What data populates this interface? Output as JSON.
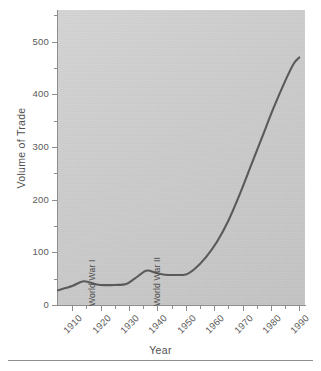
{
  "chart_data": {
    "type": "line",
    "title": "",
    "xlabel": "Year",
    "ylabel": "Volume of Trade",
    "xlim": [
      1905,
      1992
    ],
    "ylim": [
      0,
      560
    ],
    "grid": false,
    "legend": "none",
    "y_ticks_major": [
      0,
      100,
      200,
      300,
      400,
      500
    ],
    "y_ticks_minor": [
      50,
      150,
      250,
      350,
      450,
      550
    ],
    "x_ticks_major": [
      1910,
      1920,
      1930,
      1940,
      1950,
      1960,
      1970,
      1980,
      1990
    ],
    "x_ticks_minor": [
      1915,
      1925,
      1935,
      1945,
      1955,
      1965,
      1975,
      1985
    ],
    "x_tick_labels": [
      "1910",
      "1920",
      "1930",
      "1940",
      "1950",
      "1960",
      "1970",
      "1980",
      "1990"
    ],
    "y_tick_labels": [
      "0",
      "100",
      "200",
      "300",
      "400",
      "500"
    ],
    "line_color": "#5a5a5a",
    "plot_background": "#cbcbcb",
    "series": [
      {
        "name": "Volume of Trade",
        "x": [
          1905,
          1910,
          1914,
          1918,
          1920,
          1925,
          1929,
          1932,
          1936,
          1939,
          1942,
          1946,
          1950,
          1953,
          1957,
          1961,
          1965,
          1969,
          1973,
          1977,
          1981,
          1985,
          1988,
          1990
        ],
        "values": [
          28,
          36,
          45,
          40,
          38,
          38,
          40,
          50,
          65,
          62,
          58,
          57,
          58,
          68,
          90,
          120,
          160,
          210,
          265,
          320,
          375,
          425,
          458,
          470
        ]
      }
    ],
    "annotations": [
      {
        "text": "World War I",
        "x": 1920,
        "rotation": -90
      },
      {
        "text": "World War II",
        "x": 1943,
        "rotation": -90
      }
    ]
  },
  "footer": {
    "caption": ""
  }
}
